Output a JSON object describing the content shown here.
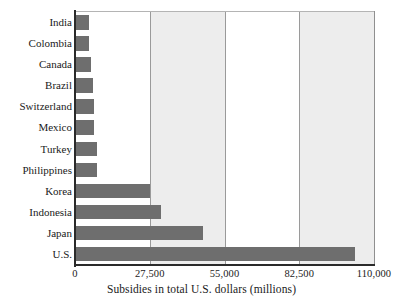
{
  "chart_data": {
    "type": "bar",
    "orientation": "horizontal",
    "title": "",
    "xlabel": "Subsidies in total U.S. dollars (millions)",
    "ylabel": "",
    "xlim": [
      0,
      110000
    ],
    "xticks": [
      0,
      27500,
      55000,
      82500,
      110000
    ],
    "xtick_labels": [
      "0",
      "27,500",
      "55,000",
      "82,500",
      "110,000"
    ],
    "grid": "vertical",
    "legend": "none",
    "bar_color": "#6e6e6e",
    "band_color": "#ededed",
    "categories": [
      "India",
      "Colombia",
      "Canada",
      "Brazil",
      "Switzerland",
      "Mexico",
      "Turkey",
      "Philippines",
      "Korea",
      "Indonesia",
      "Japan",
      "U.S."
    ],
    "values": [
      4800,
      4900,
      5600,
      6200,
      6500,
      6600,
      7600,
      7700,
      27300,
      31500,
      46800,
      103000
    ]
  },
  "axis": {
    "x_title": "Subsidies in total U.S. dollars (millions)"
  }
}
